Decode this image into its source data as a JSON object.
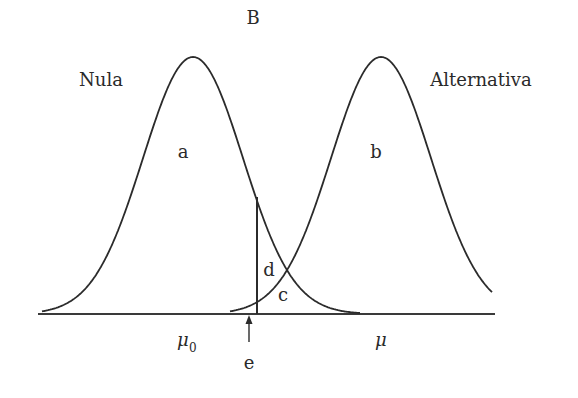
{
  "figure": {
    "title": "B",
    "null_label": "Nula",
    "alt_label": "Alternativa",
    "region_labels": {
      "a": "a",
      "b": "b",
      "c": "c",
      "d": "d",
      "e": "e"
    },
    "axis_labels": {
      "mu0_symbol": "μ",
      "mu0_subscript": "0",
      "mu": "μ"
    },
    "colors": {
      "line": "#2b2b2b",
      "background": "#ffffff"
    }
  },
  "chart_data": {
    "type": "diagram",
    "title": "B",
    "distributions": [
      {
        "name": "Nula",
        "center_label": "μ0",
        "region_label": "a"
      },
      {
        "name": "Alternativa",
        "center_label": "μ",
        "region_label": "b"
      }
    ],
    "annotations": [
      "a",
      "b",
      "c",
      "d",
      "e"
    ],
    "critical_line_label": "e"
  }
}
